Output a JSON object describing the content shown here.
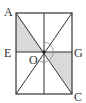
{
  "diagram": {
    "type": "geometry-rectangle",
    "labels": {
      "A": "A",
      "E": "E",
      "O": "O",
      "G": "G",
      "C": "C"
    },
    "colors": {
      "line": "#333333",
      "shade": "#d9d9d9",
      "arc": "#888888",
      "background": "#ffffff"
    },
    "shaded_regions": [
      "triangle A-E-O",
      "triangle O-G-C"
    ]
  }
}
